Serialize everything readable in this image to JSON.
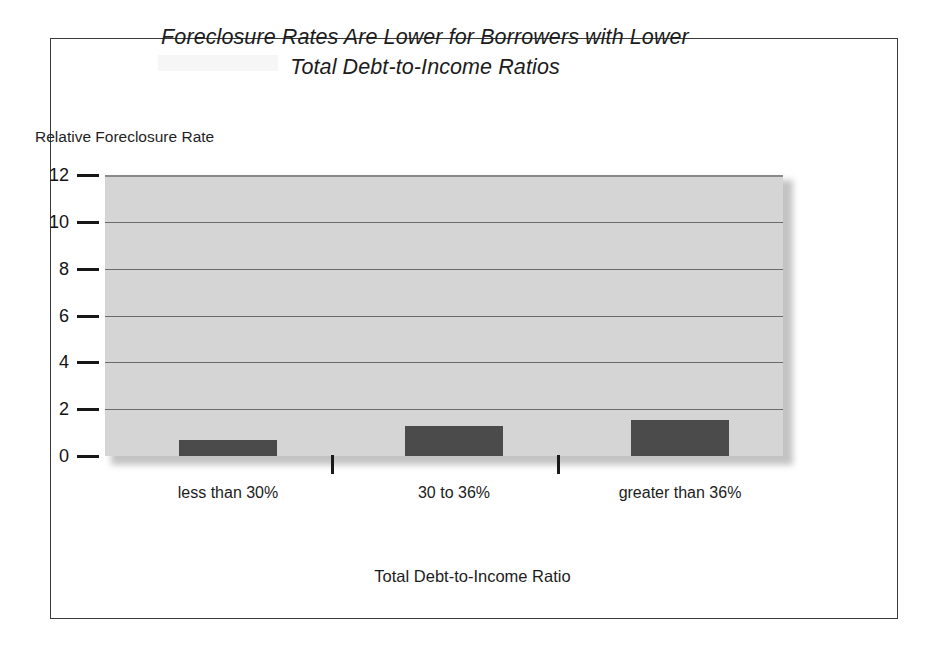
{
  "figure": {
    "title_line1": "Foreclosure Rates Are Lower for Borrowers with Lower",
    "title_line2": "Total Debt-to-Income Ratios",
    "frame_color": "#3a3a3a",
    "background_color": "#ffffff"
  },
  "chart_data": {
    "type": "bar",
    "title": "Foreclosure Rates Are Lower for Borrowers with Lower Total Debt-to-Income Ratios",
    "categories": [
      "less than 30%",
      "30 to 36%",
      "greater than 36%"
    ],
    "values": [
      0.7,
      1.3,
      1.55
    ],
    "xlabel": "Total Debt-to-Income Ratio",
    "ylabel": "Relative Foreclosure Rate",
    "ylim": [
      0,
      12
    ],
    "yticks": [
      0,
      2,
      4,
      6,
      8,
      10,
      12
    ],
    "ytick_labels": [
      "0",
      "2",
      "4",
      "6",
      "8",
      "10",
      "12"
    ],
    "grid": true,
    "legend": false,
    "bar_color": "#4b4b4b",
    "plot_background_color": "#d5d5d5"
  }
}
